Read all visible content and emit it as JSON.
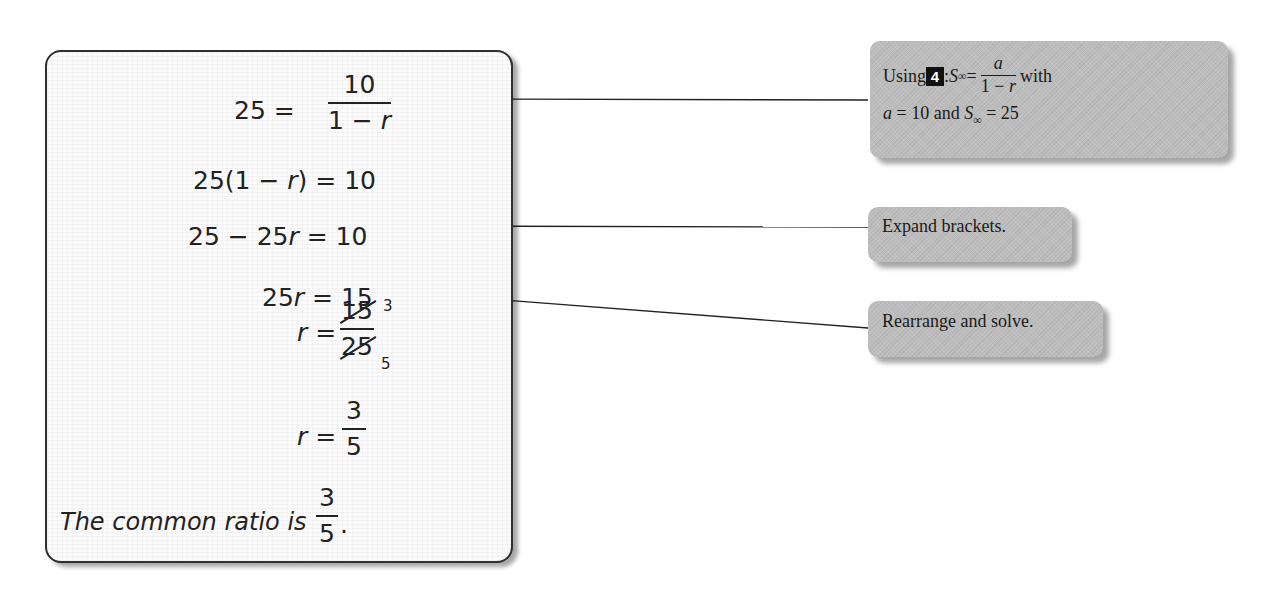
{
  "worked_solution": {
    "step1": {
      "lhs": "25",
      "equals": "=",
      "numerator": "10",
      "denominator_a": "1 − ",
      "denominator_var": "r"
    },
    "step2": {
      "text_a": "25(1 − ",
      "var": "r",
      "text_b": ") = 10"
    },
    "step3": {
      "text_a": "25 − 25",
      "var": "r",
      "text_b": " = 10"
    },
    "step4": {
      "text_a": "25",
      "var": "r",
      "text_b": " = 15"
    },
    "step5": {
      "var": "r",
      "equals": " =",
      "numerator": "15",
      "numerator_simplified": "3",
      "denominator": "25",
      "denominator_simplified": "5"
    },
    "step6": {
      "var": "r",
      "equals": " =",
      "numerator": "3",
      "denominator": "5"
    },
    "conclusion": {
      "text": "The common ratio is ",
      "numerator": "3",
      "denominator": "5",
      "end": "."
    }
  },
  "callouts": [
    {
      "prefix": "Using ",
      "badge": "4",
      "after_badge": ": ",
      "formula_symbol": "S",
      "formula_subscript": "∞",
      "formula_equals": " =",
      "formula_numerator": "a",
      "formula_denominator_a": "1 − ",
      "formula_denominator_var": "r",
      "suffix": " with",
      "line2_var": "a",
      "line2_text_a": " = 10 and ",
      "line2_symbol": "S",
      "line2_subscript": "∞",
      "line2_text_b": " = 25"
    },
    {
      "text": "Expand brackets."
    },
    {
      "text": "Rearrange and solve."
    }
  ],
  "colors": {
    "callout_bg": "#bdbdbd",
    "ink": "#222222",
    "badge_bg": "#111111"
  }
}
